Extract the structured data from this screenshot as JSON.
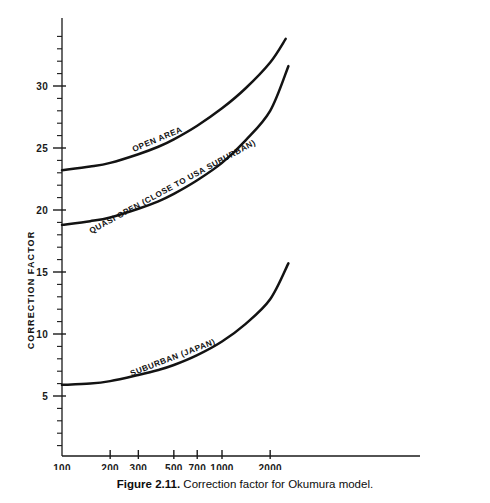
{
  "caption": {
    "label": "Figure 2.11.",
    "text": "Correction factor for Okumura model."
  },
  "chart_data": {
    "type": "line",
    "title": "Correction factor for Okumura model",
    "xlabel": "",
    "ylabel": "CORRECTION FACTOR",
    "xscale": "log",
    "xlim": [
      100,
      2600
    ],
    "ylim": [
      0,
      35
    ],
    "grid": false,
    "legend": "inline-curve-labels",
    "x_ticks": [
      100,
      200,
      300,
      500,
      700,
      1000,
      2000
    ],
    "x_tick_labels": [
      "100",
      "200",
      "300",
      "500",
      "700",
      "1000",
      "2000"
    ],
    "y_ticks": [
      5,
      10,
      15,
      20,
      25,
      30
    ],
    "y_tick_labels": [
      "5",
      "10",
      "15",
      "20",
      "25",
      "30"
    ],
    "y_minor_tick_step": 1,
    "series": [
      {
        "name": "OPEN AREA",
        "x": [
          100,
          150,
          200,
          300,
          400,
          500,
          700,
          1000,
          1400,
          2000,
          2500
        ],
        "values": [
          23.2,
          23.5,
          23.8,
          24.5,
          25.1,
          25.7,
          26.8,
          28.2,
          29.8,
          31.9,
          33.8
        ]
      },
      {
        "name": "QUASI OPEN (CLOSE TO USA SUBURBAN)",
        "x": [
          100,
          150,
          200,
          300,
          400,
          500,
          700,
          1000,
          1400,
          2000,
          2600
        ],
        "values": [
          18.8,
          19.1,
          19.4,
          20.1,
          20.7,
          21.3,
          22.4,
          23.8,
          25.6,
          28.0,
          31.6
        ]
      },
      {
        "name": "SUBURBAN (JAPAN)",
        "x": [
          100,
          150,
          200,
          300,
          400,
          500,
          700,
          1000,
          1400,
          2000,
          2600
        ],
        "values": [
          5.9,
          6.0,
          6.2,
          6.7,
          7.1,
          7.5,
          8.3,
          9.4,
          10.8,
          12.8,
          15.7
        ]
      }
    ]
  },
  "axis": {
    "y_title": "CORRECTION FACTOR"
  },
  "colors": {
    "curve": "#131313",
    "axis": "#1a1a1a",
    "background": "#ffffff"
  }
}
